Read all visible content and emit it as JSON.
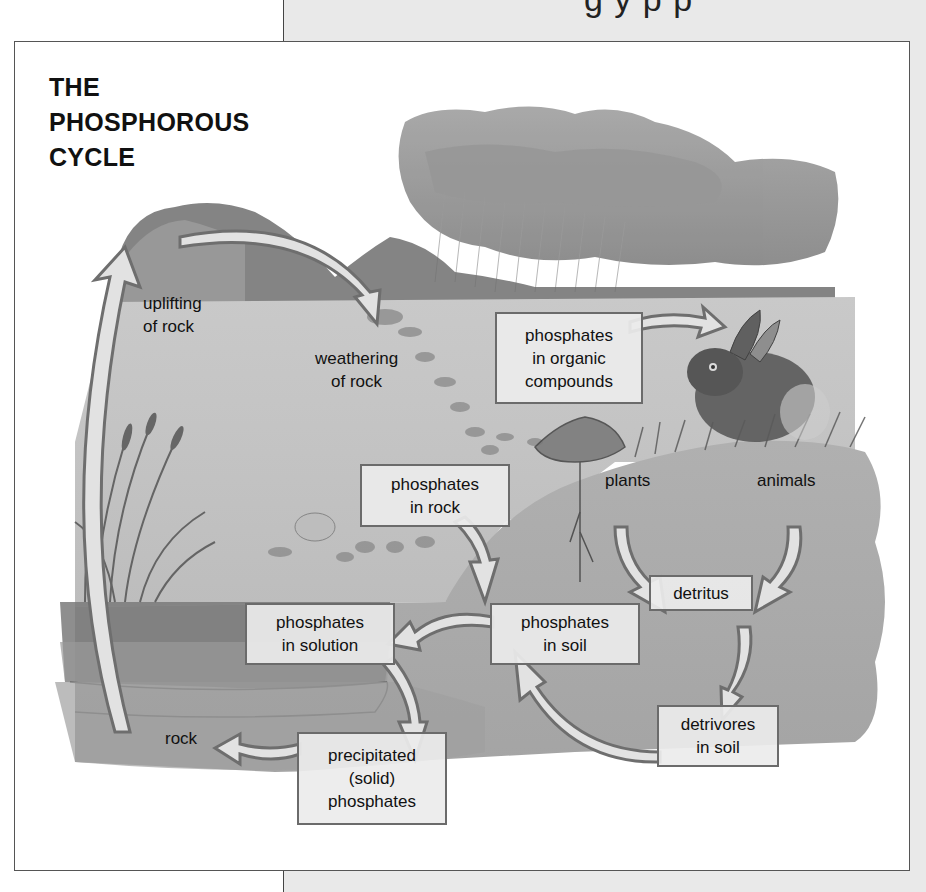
{
  "page": {
    "partial_header_text": "g y   p  p  "
  },
  "diagram": {
    "title_lines": [
      "THE",
      "PHOSPHOROUS",
      "CYCLE"
    ],
    "labels": {
      "uplifting": [
        "uplifting",
        "of rock"
      ],
      "weathering": [
        "weathering",
        "of rock"
      ],
      "plants": "plants",
      "animals": "animals",
      "rock": "rock"
    },
    "boxes": {
      "organic": [
        "phosphates",
        "in organic",
        "compounds"
      ],
      "in_rock": [
        "phosphates",
        "in rock"
      ],
      "solution": [
        "phosphates",
        "in solution"
      ],
      "soil": [
        "phosphates",
        "in soil"
      ],
      "detritus": [
        "detritus"
      ],
      "detrivores": [
        "detrivores",
        "in soil"
      ],
      "precipitated": [
        "precipitated",
        "(solid)",
        "phosphates"
      ]
    },
    "flows": [
      {
        "from": "rock",
        "to": "uplifting of rock"
      },
      {
        "from": "uplifting of rock",
        "to": "weathering of rock"
      },
      {
        "from": "phosphates in organic compounds",
        "to": "animals"
      },
      {
        "from": "phosphates in rock",
        "to": "phosphates in soil"
      },
      {
        "from": "plants",
        "to": "detritus"
      },
      {
        "from": "animals",
        "to": "detritus"
      },
      {
        "from": "detritus",
        "to": "detrivores in soil"
      },
      {
        "from": "detrivores in soil",
        "to": "phosphates in soil"
      },
      {
        "from": "phosphates in soil",
        "to": "phosphates in solution"
      },
      {
        "from": "phosphates in solution",
        "to": "precipitated (solid) phosphates"
      },
      {
        "from": "precipitated (solid) phosphates",
        "to": "rock"
      }
    ],
    "colors": {
      "arrow_stroke": "#6e6e6e",
      "arrow_fill": "#e2e2e2",
      "box_border": "#6b6b6b",
      "box_fill": "#ececec",
      "frame_border": "#555555",
      "panel_bg": "#e9e9e9"
    }
  }
}
